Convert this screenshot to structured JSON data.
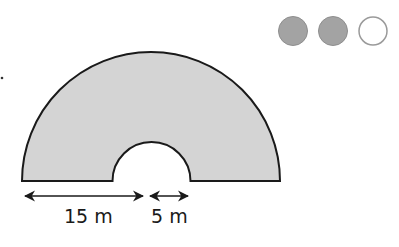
{
  "figure": {
    "shape": "semicircular arch (semicircle with semicircular hole)",
    "fill_color": "#d4d4d4",
    "stroke_color": "#1a1a1a",
    "outer_semicircle": {
      "center_x": 151,
      "baseline_y": 181,
      "radius": 129
    },
    "inner_semicircle": {
      "center_x": 151.5,
      "baseline_y": 181,
      "radius": 39
    }
  },
  "dimensions": [
    {
      "label": "15 m",
      "measures": "width of arch base (outer radius minus inner radius)"
    },
    {
      "label": "5 m",
      "measures": "inner semicircle radius"
    }
  ],
  "difficulty": {
    "filled_dots": 2,
    "total_dots": 3,
    "filled_color": "#a0a0a0",
    "empty_color": "#ffffff"
  }
}
